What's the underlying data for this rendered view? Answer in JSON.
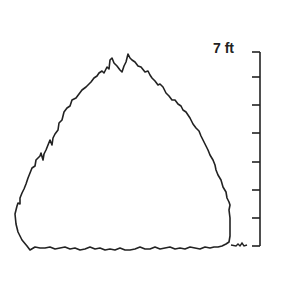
{
  "diagram": {
    "type": "tunnel-cross-section-profile",
    "scale": {
      "label": "7 ft",
      "max_value": 7,
      "unit": "ft",
      "tick_count": 8,
      "tick_spacing_px": 28
    },
    "line_color": "#222222",
    "background": "#ffffff"
  }
}
